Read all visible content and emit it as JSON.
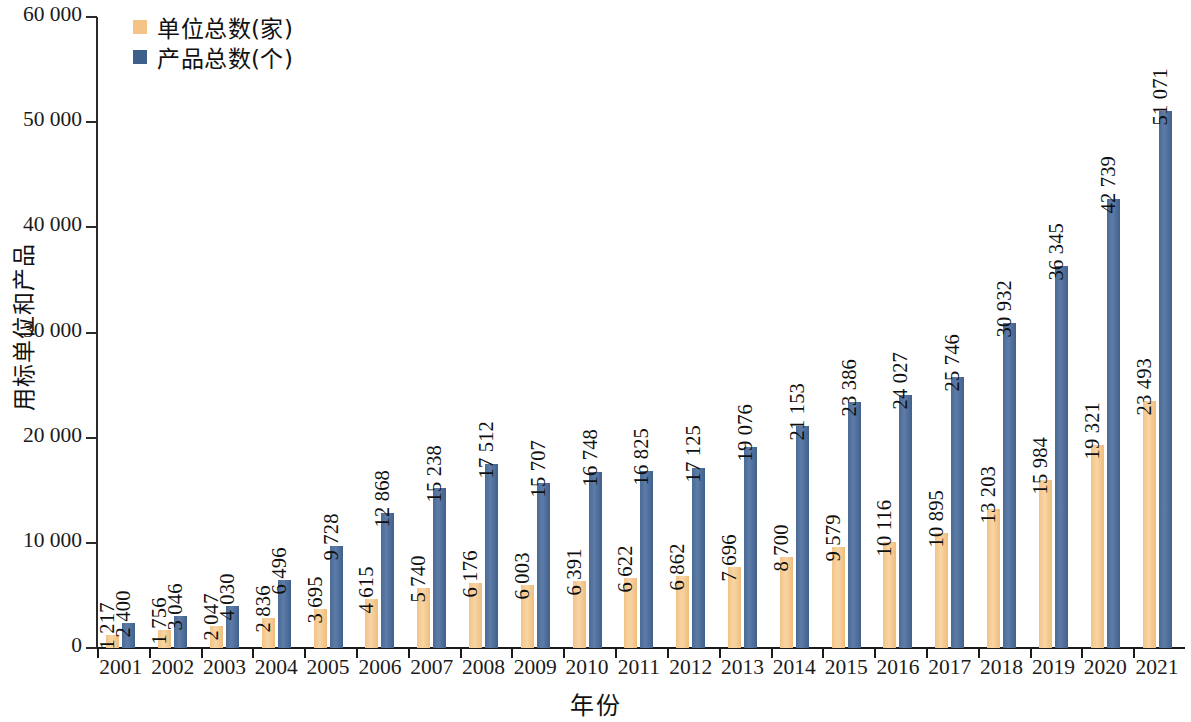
{
  "chart_data": {
    "type": "bar",
    "title": "",
    "xlabel": "年份",
    "ylabel": "用标单位和产品",
    "ylim": [
      0,
      60000
    ],
    "ytick_step": 10000,
    "grid": false,
    "legend_position": "top-left",
    "categories": [
      "2001",
      "2002",
      "2003",
      "2004",
      "2005",
      "2006",
      "2007",
      "2008",
      "2009",
      "2010",
      "2011",
      "2012",
      "2013",
      "2014",
      "2015",
      "2016",
      "2017",
      "2018",
      "2019",
      "2020",
      "2021"
    ],
    "ytick_labels": [
      "0",
      "10 000",
      "20 000",
      "30 000",
      "40 000",
      "50 000",
      "60 000"
    ],
    "ytick_values": [
      0,
      10000,
      20000,
      30000,
      40000,
      50000,
      60000
    ],
    "series": [
      {
        "name": "单位总数(家)",
        "color": "#F3C388",
        "values": [
          1217,
          1756,
          2047,
          2836,
          3695,
          4615,
          5740,
          6176,
          6003,
          6391,
          6622,
          6862,
          7696,
          8700,
          9579,
          10116,
          10895,
          13203,
          15984,
          19321,
          23493
        ],
        "labels": [
          "1 217",
          "1 756",
          "2 047",
          "2 836",
          "3 695",
          "4 615",
          "5 740",
          "6 176",
          "6 003",
          "6 391",
          "6 622",
          "6 862",
          "7 696",
          "8 700",
          "9 579",
          "10 116",
          "10 895",
          "13 203",
          "15 984",
          "19 321",
          "23 493"
        ]
      },
      {
        "name": "产品总数(个)",
        "color": "#4A6B96",
        "values": [
          2400,
          3046,
          4030,
          6496,
          9728,
          12868,
          15238,
          17512,
          15707,
          16748,
          16825,
          17125,
          19076,
          21153,
          23386,
          24027,
          25746,
          30932,
          36345,
          42739,
          51071
        ],
        "labels": [
          "2 400",
          "3 046",
          "4 030",
          "6 496",
          "9 728",
          "12 868",
          "15 238",
          "17 512",
          "15 707",
          "16 748",
          "16 825",
          "17 125",
          "19 076",
          "21 153",
          "23 386",
          "24 027",
          "25 746",
          "30 932",
          "36 345",
          "42 739",
          "51 071"
        ]
      }
    ]
  }
}
